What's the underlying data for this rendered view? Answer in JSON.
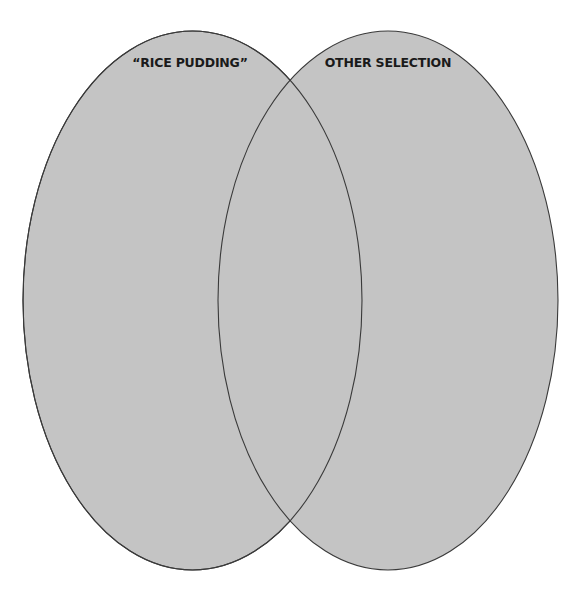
{
  "diagram": {
    "type": "venn",
    "background": "#ffffff",
    "fill_color": "#c4c4c4",
    "stroke_color": "#3a3a3a",
    "sets": [
      {
        "id": "left",
        "label": "“RICE PUDDING”",
        "cx": 192.5,
        "cy": 300.5,
        "rx": 169.5,
        "ry": 269.5
      },
      {
        "id": "right",
        "label": "OTHER SELECTION",
        "cx": 388,
        "cy": 300.5,
        "rx": 170,
        "ry": 269.5
      }
    ],
    "overlap_label": ""
  }
}
